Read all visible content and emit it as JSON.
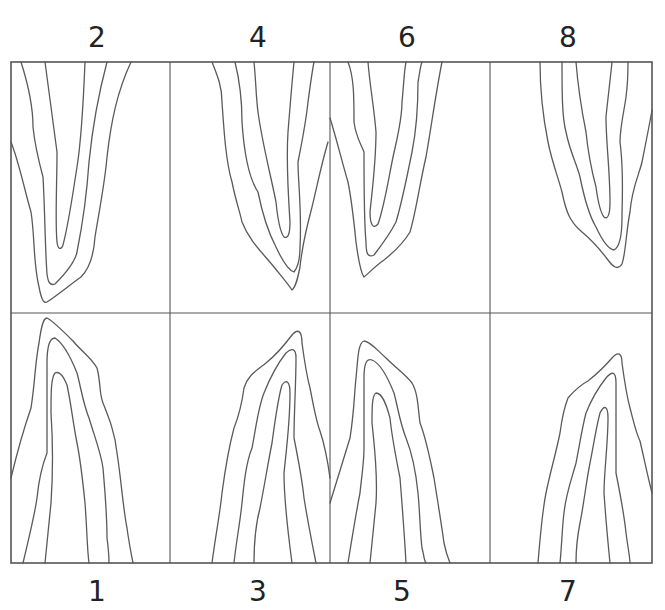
{
  "figure": {
    "frame": {
      "x": 11,
      "y": 62,
      "width": 641,
      "height": 501
    },
    "vertical_dividers_x": [
      170,
      330,
      490
    ],
    "horizontal_divider_y": 313,
    "stroke_color": "#555555",
    "label_color": "#222222"
  },
  "labels": {
    "top": [
      {
        "text": "2",
        "x": 97,
        "y": 22
      },
      {
        "text": "4",
        "x": 258,
        "y": 22
      },
      {
        "text": "6",
        "x": 407,
        "y": 22
      },
      {
        "text": "8",
        "x": 568,
        "y": 22
      }
    ],
    "bottom": [
      {
        "text": "1",
        "x": 97,
        "y": 576
      },
      {
        "text": "3",
        "x": 258,
        "y": 576
      },
      {
        "text": "5",
        "x": 402,
        "y": 576
      },
      {
        "text": "7",
        "x": 568,
        "y": 576
      }
    ]
  },
  "panels": [
    {
      "id": "panel-2",
      "number": "2",
      "row": "top",
      "direction": "down",
      "origin": [
        11,
        62
      ],
      "contours": [
        "M0,80 C8,100 14,130 20,150 C24,175 22,200 28,225 C30,235 32,242 36,240 C48,232 60,222 70,215 C80,205 83,190 84,175 C88,150 94,120 96,95 C100,60 106,30 120,0",
        "M10,0 C18,25 22,45 22,65 C24,85 28,100 32,115 C34,150 34,185 36,212 C37,220 39,224 44,222 C54,212 64,200 66,190 C72,160 76,130 78,100 C82,60 88,30 96,0",
        "M34,0 C38,30 42,60 46,90 C46,120 44,160 46,180 C47,188 50,188 52,183 C58,160 62,130 66,105 C70,80 72,50 74,0"
      ]
    },
    {
      "id": "panel-4",
      "number": "4",
      "row": "top",
      "direction": "down",
      "origin": [
        170,
        62
      ],
      "contours": [
        "M42,0 C48,15 52,25 52,40 C54,70 56,100 62,120 C66,140 70,150 72,160 C80,180 92,190 104,205 C112,215 118,222 122,228 C126,225 128,215 130,205 C132,185 138,160 142,145 C148,120 152,100 158,80",
        "M65,0 C70,20 72,40 72,60 C74,90 78,115 88,130 C92,150 98,170 106,185 C112,198 118,208 124,210 C128,205 130,195 130,185 C132,150 128,120 128,100 C132,80 136,60 138,40 C140,25 142,10 144,0",
        "M84,0 C86,20 86,35 88,50 C92,80 100,110 106,140 C108,160 110,170 114,175 C118,177 120,172 120,160 C118,130 116,100 118,70 C120,45 122,20 124,0"
      ]
    },
    {
      "id": "panel-6",
      "number": "6",
      "row": "top",
      "direction": "down",
      "origin": [
        330,
        62
      ],
      "contours": [
        "M0,56 C6,75 12,100 18,120 C22,140 24,160 26,180 C28,195 30,210 34,215 C38,212 44,205 54,198 C64,190 74,180 80,170 C86,150 90,120 96,95 C102,60 106,30 112,0",
        "M18,0 C24,15 24,35 24,60 C26,75 30,80 34,90 C34,130 34,160 36,180 C36,192 38,196 44,193 C54,180 62,168 66,160 C72,140 78,110 82,90 C86,70 88,40 88,20 C90,10 90,5 92,0",
        "M38,0 C40,25 44,45 46,70 C46,100 42,130 40,150 C40,162 43,168 48,162 C54,145 58,120 62,100 C66,80 72,60 72,40 C74,20 74,10 76,0"
      ]
    },
    {
      "id": "panel-8",
      "number": "8",
      "row": "top",
      "direction": "down",
      "origin": [
        490,
        62
      ],
      "contours": [
        "M50,0 C50,30 54,60 58,80 C62,100 68,115 72,130 C76,150 80,160 92,170 C104,180 112,190 118,198 C124,206 128,208 132,202 C136,190 136,170 140,150 C142,125 150,110 152,100 C156,80 160,60 162,48",
        "M72,0 C72,30 72,55 76,70 C80,90 86,100 90,115 C94,135 100,155 106,165 C112,178 118,187 124,188 C130,185 132,170 132,155 C132,140 134,110 130,80 C130,65 134,50 136,35 C138,20 138,10 138,0",
        "M86,0 C88,25 92,50 96,70 C98,90 102,110 106,125 C108,140 110,150 114,155 C118,158 120,152 120,140 C120,110 116,80 116,55 C118,35 120,20 122,0"
      ]
    },
    {
      "id": "panel-1",
      "number": "1",
      "row": "bottom",
      "direction": "up",
      "origin": [
        11,
        313
      ],
      "contours": [
        "M0,165 C6,140 12,118 20,95 C24,70 24,50 28,30 C30,15 32,5 36,5 C42,8 52,18 62,28 C70,38 80,44 86,55 C90,70 88,80 92,90 C98,105 104,120 106,140 C110,165 112,195 116,215 C118,230 120,240 122,250",
        "M12,250 C18,225 24,200 26,185 C28,165 32,150 36,140 C36,110 36,80 36,50 C36,35 38,25 44,25 C52,30 60,45 66,60 C70,75 72,90 78,105 C84,125 90,140 92,155 C94,180 96,200 96,225 C98,240 98,245 98,250",
        "M34,250 C36,230 38,210 40,190 C42,160 42,130 40,100 C40,80 40,65 44,60 C48,58 52,62 56,72 C60,90 62,110 66,130 C70,150 72,170 74,190 C76,215 76,235 78,250"
      ]
    },
    {
      "id": "panel-3",
      "number": "3",
      "row": "bottom",
      "direction": "up",
      "origin": [
        170,
        313
      ],
      "contours": [
        "M42,250 C46,220 50,200 52,180 C56,150 60,130 64,115 C70,100 72,90 74,75 C78,62 86,58 96,50 C106,42 116,30 122,22 C128,15 132,18 132,30 C134,45 136,60 140,75 C144,95 146,108 150,118 C154,130 158,150 160,165",
        "M64,250 C66,230 70,210 72,190 C74,170 76,150 82,135 C86,115 88,95 94,80 C100,65 108,50 116,40 C122,35 126,35 126,45 C126,70 124,100 124,125 C128,145 132,165 134,185 C138,210 142,230 146,250",
        "M84,250 C84,230 86,210 90,195 C94,175 98,150 102,130 C106,100 108,85 112,72 C116,66 120,68 120,80 C120,110 116,140 114,160 C114,190 118,220 122,250"
      ]
    },
    {
      "id": "panel-5",
      "number": "5",
      "row": "bottom",
      "direction": "up",
      "origin": [
        330,
        313
      ],
      "contours": [
        "M0,190 C6,170 14,145 20,125 C24,100 24,85 26,65 C28,45 28,30 34,28 C40,28 48,38 56,45 C66,55 76,62 82,70 C88,80 88,95 90,110 C96,125 100,145 104,165 C108,190 112,215 114,230 C116,240 118,245 120,250",
        "M18,250 C22,225 26,200 30,180 C32,160 34,150 34,135 C34,110 34,90 34,65 C34,52 36,45 42,47 C50,50 58,65 64,80 C68,95 70,110 76,125 C82,140 86,160 88,180 C90,200 90,220 92,235 C94,242 94,248 96,250",
        "M40,250 C42,230 44,210 46,190 C48,160 44,130 42,110 C42,95 42,82 46,80 C52,80 56,90 60,105 C62,125 66,145 70,165 C72,190 74,215 76,250"
      ]
    },
    {
      "id": "panel-7",
      "number": "7",
      "row": "bottom",
      "direction": "up",
      "origin": [
        490,
        313
      ],
      "contours": [
        "M48,250 C50,225 52,200 56,180 C60,160 66,140 70,120 C72,105 74,95 78,85 C84,78 90,72 98,68 C108,60 116,52 122,45 C128,38 132,40 132,50 C134,65 136,80 140,95 C144,110 146,120 150,128 C154,145 158,165 162,180",
        "M70,250 C72,230 72,215 74,200 C76,180 82,165 86,150 C90,130 92,115 96,100 C102,85 108,75 116,65 C122,58 126,58 126,70 C126,100 126,130 126,160 C130,180 134,200 136,220 C138,235 140,245 140,250",
        "M86,250 C86,235 88,220 90,210 C94,190 96,170 100,150 C104,130 106,115 110,100 C114,92 118,92 118,105 C118,130 114,160 114,180 C116,210 118,230 120,250"
      ]
    }
  ]
}
